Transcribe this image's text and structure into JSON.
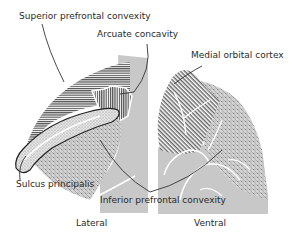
{
  "labels": {
    "superior_prefrontal_convexity": "Superior prefrontal convexity",
    "arcuate_concavity": "Arcuate concavity",
    "medial_orbital_cortex": "Medial orbital cortex",
    "sulcus_principalis": "Sulcus principalis",
    "inferior_prefrontal_convexity": "Inferior prefrontal convexity"
  },
  "views": {
    "lateral": "Lateral",
    "ventral": "Ventral"
  },
  "regions": [
    {
      "name": "Superior prefrontal convexity",
      "pattern": "horizontal-hatch"
    },
    {
      "name": "Arcuate concavity",
      "pattern": "vertical-hatch"
    },
    {
      "name": "Sulcus principalis",
      "pattern": "stippled-outline"
    },
    {
      "name": "Inferior prefrontal convexity",
      "pattern": "cross-dots"
    },
    {
      "name": "Medial orbital cortex",
      "pattern": "diagonal-hatch"
    }
  ],
  "colors": {
    "hatch": "#333333",
    "gray_fill": "#c8c8c8",
    "sulcus_line": "#ffffff",
    "leader": "#333333"
  }
}
